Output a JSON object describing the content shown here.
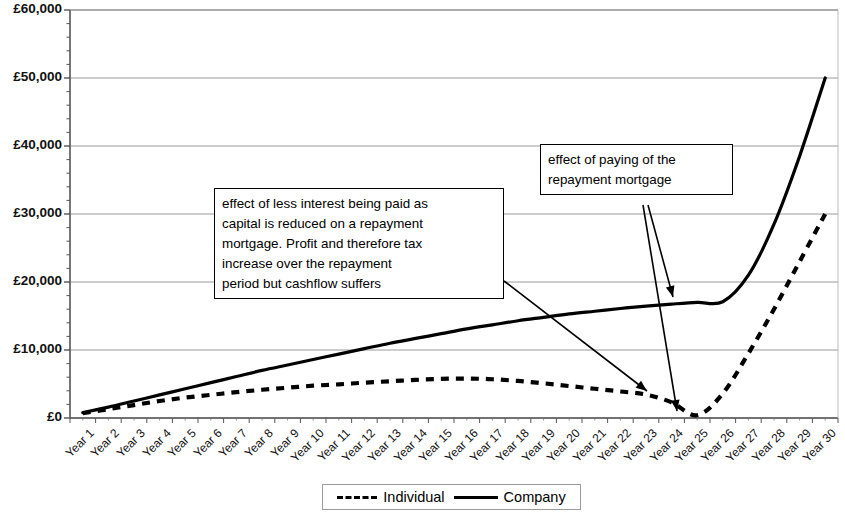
{
  "chart_data": {
    "type": "line",
    "title": "",
    "xlabel": "",
    "ylabel": "",
    "ylim": [
      0,
      60000
    ],
    "grid": true,
    "legend_position": "bottom",
    "y_ticks": [
      "£0",
      "£10,000",
      "£20,000",
      "£30,000",
      "£40,000",
      "£50,000",
      "£60,000"
    ],
    "y_tick_values": [
      0,
      10000,
      20000,
      30000,
      40000,
      50000,
      60000
    ],
    "categories": [
      "Year 1",
      "Year 2",
      "Year 3",
      "Year 4",
      "Year 5",
      "Year 6",
      "Year 7",
      "Year 8",
      "Year 9",
      "Year 10",
      "Year 11",
      "Year 12",
      "Year 13",
      "Year 14",
      "Year 15",
      "Year 16",
      "Year 17",
      "Year 18",
      "Year 19",
      "Year 20",
      "Year 21",
      "Year 22",
      "Year 23",
      "Year 24",
      "Year 25",
      "Year 26",
      "Year 27",
      "Year 28",
      "Year 29",
      "Year 30"
    ],
    "series": [
      {
        "name": "Individual",
        "style": "dashed",
        "color": "#000000",
        "values": [
          700,
          1300,
          1900,
          2500,
          3000,
          3400,
          3800,
          4150,
          4450,
          4750,
          4950,
          5200,
          5400,
          5600,
          5750,
          5800,
          5700,
          5450,
          5100,
          4700,
          4300,
          3900,
          3450,
          2300,
          400,
          3600,
          9500,
          16000,
          23000,
          30000
        ]
      },
      {
        "name": "Company",
        "style": "solid",
        "color": "#000000",
        "values": [
          800,
          1600,
          2500,
          3400,
          4300,
          5200,
          6100,
          7000,
          7800,
          8600,
          9400,
          10200,
          11000,
          11700,
          12400,
          13100,
          13700,
          14300,
          14800,
          15300,
          15700,
          16100,
          16450,
          16750,
          17000,
          17100,
          21000,
          28500,
          38500,
          50000
        ]
      }
    ],
    "annotations": [
      {
        "id": "annotation-interest-capital",
        "lines": [
          "effect of less interest being paid as",
          "capital is reduced on a repayment",
          "mortgage.  Profit and therefore tax",
          "increase over the repayment",
          "period but cashflow suffers"
        ],
        "target": "Individual series around Year 23"
      },
      {
        "id": "annotation-repayment-paid-off",
        "lines": [
          "effect of paying of the",
          "repayment mortgage"
        ],
        "target": "Year 25 trough on both series"
      }
    ]
  },
  "legend": {
    "items": [
      {
        "label": "Individual",
        "key": "dashed-line-key"
      },
      {
        "label": "Company",
        "key": "solid-line-key"
      }
    ]
  }
}
